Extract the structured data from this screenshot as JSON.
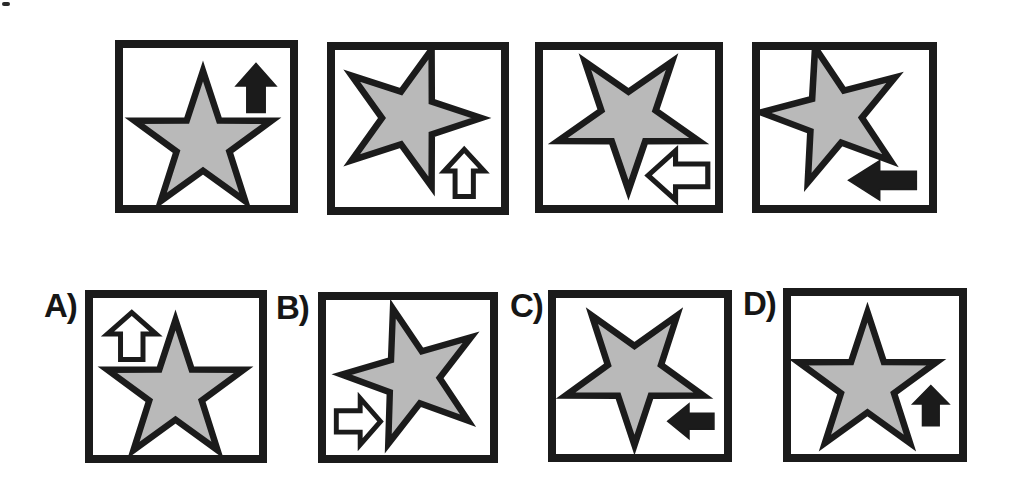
{
  "colors": {
    "background": "#ffffff",
    "star_fill": "#b9b9b9",
    "outline": "#1b1b1b",
    "arrow_outline_fill": "#ffffff"
  },
  "star": {
    "outer_radius": 72,
    "inner_radius_ratio": 0.385,
    "stroke_width": 6.5
  },
  "sequence": {
    "panels": [
      {
        "id": "sequence-panel-1",
        "star": {
          "rotation_deg": 0,
          "cx": 80,
          "cy": 95
        },
        "arrow": {
          "direction": "up",
          "style": "filled",
          "position": "top-right",
          "cx": 133,
          "cy": 40,
          "length": 49,
          "width": 40
        }
      },
      {
        "id": "sequence-panel-2",
        "star": {
          "rotation_deg": 18,
          "cx": 75,
          "cy": 68
        },
        "arrow": {
          "direction": "up",
          "style": "outline",
          "position": "bottom-right",
          "cx": 130,
          "cy": 123,
          "length": 47,
          "width": 40
        }
      },
      {
        "id": "sequence-panel-3",
        "star": {
          "rotation_deg": 180,
          "cx": 83,
          "cy": 70
        },
        "arrow": {
          "direction": "left",
          "style": "outline",
          "position": "bottom-right",
          "cx": 131,
          "cy": 127,
          "length": 58,
          "width": 50
        }
      },
      {
        "id": "sequence-panel-4",
        "star": {
          "rotation_deg": -15,
          "cx": 73,
          "cy": 67
        },
        "arrow": {
          "direction": "left",
          "style": "filled",
          "position": "bottom-right",
          "cx": 121,
          "cy": 132,
          "length": 67,
          "width": 40
        }
      }
    ]
  },
  "options": {
    "items": [
      {
        "label": "A)",
        "star": {
          "rotation_deg": 0,
          "cx": 83,
          "cy": 94
        },
        "arrow": {
          "direction": "up",
          "style": "outline",
          "position": "top-left",
          "cx": 39,
          "cy": 38,
          "length": 47,
          "width": 49
        }
      },
      {
        "label": "B)",
        "star": {
          "rotation_deg": -16,
          "cx": 88,
          "cy": 78
        },
        "arrow": {
          "direction": "right",
          "style": "outline",
          "position": "bottom-left",
          "cx": 33,
          "cy": 123,
          "length": 45,
          "width": 47
        }
      },
      {
        "label": "C)",
        "star": {
          "rotation_deg": 180,
          "cx": 78,
          "cy": 76
        },
        "arrow": {
          "direction": "left",
          "style": "filled",
          "position": "bottom-right",
          "cx": 134,
          "cy": 124,
          "length": 46,
          "width": 35
        }
      },
      {
        "label": "D)",
        "star": {
          "rotation_deg": 0,
          "cx": 76,
          "cy": 88
        },
        "arrow": {
          "direction": "up",
          "style": "filled",
          "position": "bottom-right",
          "cx": 139,
          "cy": 109,
          "length": 40,
          "width": 36
        }
      }
    ]
  }
}
